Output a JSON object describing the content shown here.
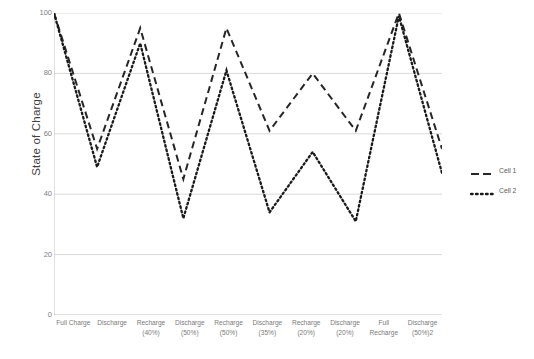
{
  "chart_data": {
    "type": "line",
    "title": "",
    "xlabel": "",
    "ylabel": "State of Charge",
    "ylim": [
      0,
      100
    ],
    "yticks": [
      0,
      20,
      40,
      60,
      80,
      100
    ],
    "grid": true,
    "legend_position": "right",
    "categories": [
      "Full Charge",
      "Discharge",
      "Recharge\n(40%)",
      "Discharge\n(50%)",
      "Recharge\n(50%)",
      "Discharge\n(35%)",
      "Recharge\n(20%)",
      "Discharge\n(20%)",
      "Full\nRecharge",
      "Discharge\n(50%)2"
    ],
    "series": [
      {
        "name": "Cell 1",
        "style": "dashed",
        "color": "#262626",
        "values": [
          100,
          55,
          95,
          45,
          95,
          61,
          80,
          61,
          100,
          55
        ]
      },
      {
        "name": "Cell 2",
        "style": "dotted",
        "color": "#1a1a1a",
        "values": [
          100,
          49,
          90,
          32,
          81,
          34,
          54,
          31,
          99,
          47
        ]
      }
    ]
  },
  "axis": {
    "y_title": "State of Charge",
    "y_tick_labels": [
      "100",
      "80",
      "60",
      "40",
      "20",
      "0"
    ]
  },
  "legend": {
    "items": [
      {
        "label": "Cell 1"
      },
      {
        "label": "Cell 2"
      }
    ]
  },
  "colors": {
    "gridline": "#d9d9d9",
    "axis_line": "#bfbfbf",
    "series_1": "#262626",
    "series_2": "#1a1a1a",
    "tick_text": "#808080",
    "background": "#ffffff"
  }
}
